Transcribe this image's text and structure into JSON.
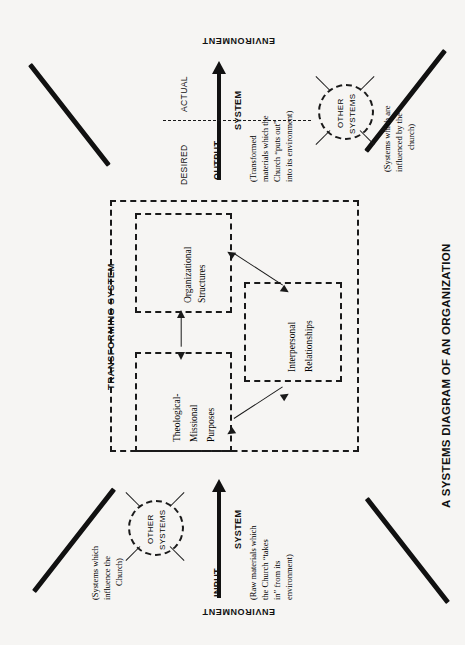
{
  "figure": {
    "title": "A SYSTEMS DIAGRAM OF AN ORGANIZATION",
    "environment_top": "ENVIRONMENT",
    "environment_bottom": "ENVIRONMENT"
  },
  "input_side": {
    "flow_label": "INPUT",
    "system_label": "SYSTEM",
    "description_lines": [
      "(Raw materials which",
      "the Church “takes",
      "in” from its",
      "environment)"
    ],
    "other_systems_label_lines": [
      "OTHER",
      "SYSTEMS"
    ],
    "other_systems_note_lines": [
      "(Systems which",
      "influence the",
      "Church)"
    ]
  },
  "output_side": {
    "flow_label": "OUTPUT",
    "system_label": "SYSTEM",
    "desired_label": "DESIRED",
    "actual_label": "ACTUAL",
    "description_lines": [
      "(Transformed",
      "materials which the",
      "Church “puts out”",
      "into its environment)"
    ],
    "other_systems_label_lines": [
      "OTHER",
      "SYSTEMS"
    ],
    "other_systems_note_lines": [
      "(Systems which are",
      "influenced by the",
      "church)"
    ]
  },
  "transforming_system": {
    "label": "TRANSFORMING SYSTEM",
    "components": [
      {
        "name": "organizational-structures",
        "lines": [
          "Organizational",
          "Structures"
        ]
      },
      {
        "name": "theological-missional-purposes",
        "lines": [
          "Theological-",
          "Missional",
          "Purposes"
        ]
      },
      {
        "name": "interpersonal-relationships",
        "lines": [
          "Interpersonal",
          "Relationships"
        ]
      }
    ]
  },
  "colors": {
    "ink": "#111111",
    "paper": "#f6f5f3"
  }
}
